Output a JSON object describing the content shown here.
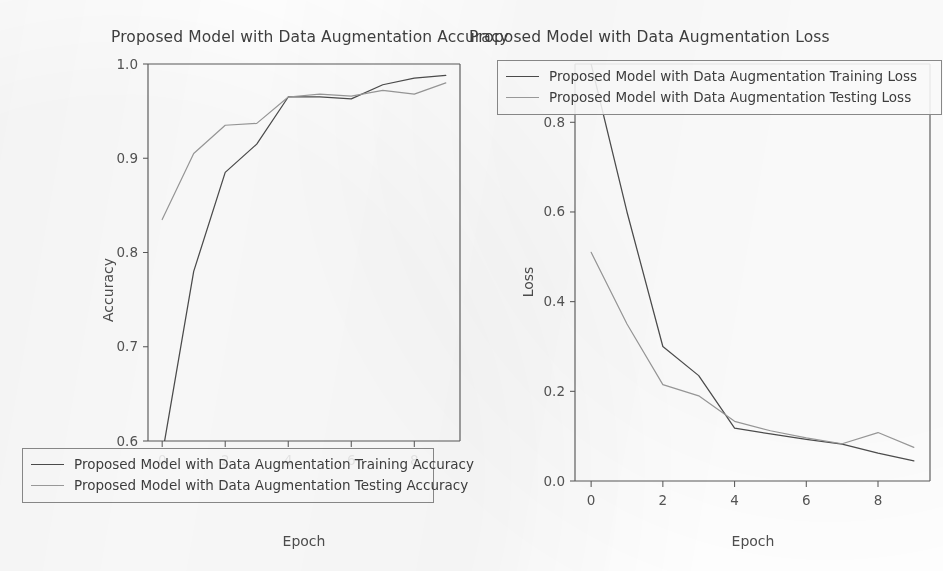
{
  "figure": {
    "background": "#ffffff",
    "ink_color": "#4d4d4d",
    "secondary_ink_color": "#9a9a9a"
  },
  "panels": {
    "accuracy": {
      "title": "Proposed Model with Data Augmentation Accuracy",
      "xlabel": "Epoch",
      "ylabel": "Accuracy",
      "legend": [
        "Proposed Model with Data Augmentation Training Accuracy",
        "Proposed Model with Data Augmentation Testing Accuracy"
      ]
    },
    "loss": {
      "title": "Proposed Model with Data Augmentation Loss",
      "xlabel": "Epoch",
      "ylabel": "Loss",
      "legend": [
        "Proposed Model with Data Augmentation Training Loss",
        "Proposed Model with Data Augmentation Testing Loss"
      ]
    }
  },
  "chart_data": [
    {
      "type": "line",
      "title": "Proposed Model with Data Augmentation Accuracy",
      "xlabel": "Epoch",
      "ylabel": "Accuracy",
      "x": [
        0,
        1,
        2,
        3,
        4,
        5,
        6,
        7,
        8,
        9
      ],
      "xticks": [
        0,
        2,
        4,
        6,
        8
      ],
      "xticklabels": [
        "0",
        "2",
        "4",
        "6",
        "8"
      ],
      "yticks": [
        0.6,
        0.7,
        0.8,
        0.9,
        1.0
      ],
      "yticklabels": [
        "0.6",
        "0.7",
        "0.8",
        "0.9",
        "1.0"
      ],
      "xlim": [
        -0.45,
        9.45
      ],
      "ylim": [
        0.6,
        1.0
      ],
      "grid": false,
      "legend_position": "lower left (outside axes)",
      "series": [
        {
          "name": "Proposed Model with Data Augmentation Training Accuracy",
          "color": "#4d4d4d",
          "values": [
            0.585,
            0.78,
            0.885,
            0.915,
            0.965,
            0.965,
            0.963,
            0.978,
            0.985,
            0.988
          ]
        },
        {
          "name": "Proposed Model with Data Augmentation Testing Accuracy",
          "color": "#9a9a9a",
          "values": [
            0.835,
            0.905,
            0.935,
            0.937,
            0.965,
            0.968,
            0.966,
            0.972,
            0.968,
            0.98
          ]
        }
      ],
      "notes": "Training accuracy at epoch 0 falls below the 0.6 axis minimum and is clipped."
    },
    {
      "type": "line",
      "title": "Proposed Model with Data Augmentation Loss",
      "xlabel": "Epoch",
      "ylabel": "Loss",
      "x": [
        0,
        1,
        2,
        3,
        4,
        5,
        6,
        7,
        8,
        9
      ],
      "xticks": [
        0,
        2,
        4,
        6,
        8
      ],
      "xticklabels": [
        "0",
        "2",
        "4",
        "6",
        "8"
      ],
      "yticks": [
        0.0,
        0.2,
        0.4,
        0.6,
        0.8
      ],
      "yticklabels": [
        "0.0",
        "0.2",
        "0.4",
        "0.6",
        "0.8"
      ],
      "xlim": [
        -0.45,
        9.45
      ],
      "ylim": [
        0.0,
        0.93
      ],
      "grid": false,
      "legend_position": "upper right (inside axes)",
      "series": [
        {
          "name": "Proposed Model with Data Augmentation Training Loss",
          "color": "#4d4d4d",
          "values": [
            0.93,
            0.6,
            0.3,
            0.235,
            0.118,
            0.105,
            0.093,
            0.082,
            0.062,
            0.045
          ]
        },
        {
          "name": "Proposed Model with Data Augmentation Testing Loss",
          "color": "#9a9a9a",
          "values": [
            0.51,
            0.35,
            0.215,
            0.19,
            0.133,
            0.112,
            0.096,
            0.083,
            0.108,
            0.075
          ]
        }
      ],
      "notes": "Training loss at epoch 0 is clipped by the top of the axes; testing loss rises at epoch 8."
    }
  ]
}
